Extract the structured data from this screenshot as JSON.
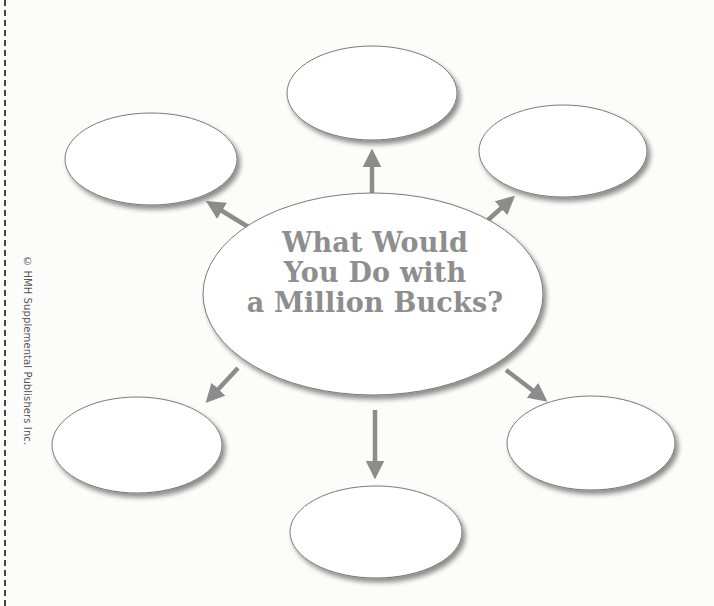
{
  "diagram": {
    "type": "web / idea map",
    "center": {
      "title_lines": [
        "What Would",
        "You Do with",
        "a Million Bucks?"
      ]
    },
    "bubbles": [
      {
        "position": "top",
        "text": ""
      },
      {
        "position": "upper-left",
        "text": ""
      },
      {
        "position": "upper-right",
        "text": ""
      },
      {
        "position": "lower-left",
        "text": ""
      },
      {
        "position": "lower-right",
        "text": ""
      },
      {
        "position": "bottom",
        "text": ""
      }
    ]
  },
  "margin": {
    "copyright": "© HMH Supplemental Publishers Inc."
  },
  "colors": {
    "arrow": "#8c8c8c",
    "title_text": "#8e8e8e",
    "ellipse_stroke": "#777777",
    "ellipse_fill": "#ffffff"
  }
}
